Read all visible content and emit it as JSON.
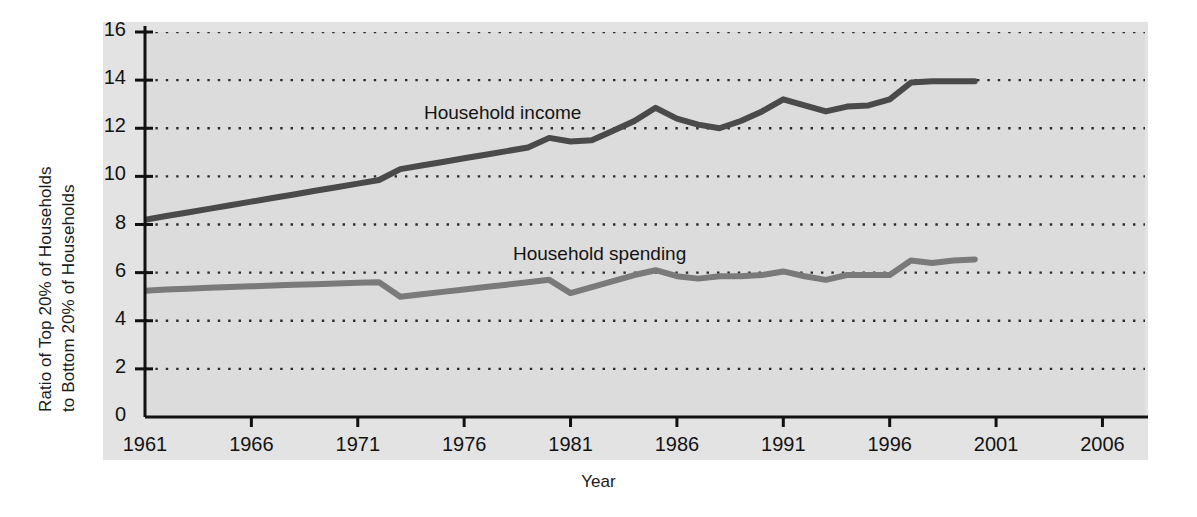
{
  "chart_data": {
    "type": "line",
    "title": "",
    "xlabel": "Year",
    "ylabel_line1": "Ratio of Top 20% of Households",
    "ylabel_line2": "to Bottom 20% of Households",
    "xlim": [
      1961,
      2008
    ],
    "ylim": [
      0,
      16
    ],
    "xticks": [
      "1961",
      "1966",
      "1971",
      "1976",
      "1981",
      "1986",
      "1991",
      "1996",
      "2001",
      "2006"
    ],
    "xtick_values": [
      1961,
      1966,
      1971,
      1976,
      1981,
      1986,
      1991,
      1996,
      2001,
      2006
    ],
    "yticks": [
      "0",
      "2",
      "4",
      "6",
      "8",
      "10",
      "12",
      "14",
      "16"
    ],
    "ytick_values": [
      0,
      2,
      4,
      6,
      8,
      10,
      12,
      14,
      16
    ],
    "grid": "horizontal-dotted",
    "legend_position": "inline-annotations",
    "plot_background": "#dcdcdc",
    "series": [
      {
        "name": "Household income",
        "color": "#4a4a4a",
        "label_x": 1973,
        "label_y": 12.6,
        "x": [
          1961,
          1962,
          1963,
          1964,
          1965,
          1966,
          1967,
          1968,
          1969,
          1970,
          1971,
          1972,
          1973,
          1974,
          1975,
          1976,
          1977,
          1978,
          1979,
          1980,
          1981,
          1982,
          1983,
          1984,
          1985,
          1986,
          1987,
          1988,
          1989,
          1990,
          1991,
          1992,
          1993,
          1994,
          1995,
          1996,
          1997,
          1998,
          1999,
          2000
        ],
        "values": [
          8.2,
          8.35,
          8.5,
          8.65,
          8.8,
          8.95,
          9.1,
          9.25,
          9.4,
          9.55,
          9.7,
          9.85,
          10.3,
          10.45,
          10.6,
          10.75,
          10.9,
          11.05,
          11.2,
          11.6,
          11.45,
          11.5,
          11.9,
          12.3,
          12.85,
          12.4,
          12.15,
          12.0,
          12.3,
          12.7,
          13.2,
          12.95,
          12.7,
          12.9,
          12.95,
          13.2,
          13.9,
          13.95,
          13.95,
          13.95
        ]
      },
      {
        "name": "Household spending",
        "color": "#7a7a7a",
        "label_x": 1980,
        "label_y": 6.9,
        "x": [
          1961,
          1962,
          1963,
          1964,
          1965,
          1966,
          1967,
          1968,
          1969,
          1970,
          1971,
          1972,
          1973,
          1974,
          1975,
          1976,
          1977,
          1978,
          1979,
          1980,
          1981,
          1982,
          1983,
          1984,
          1985,
          1986,
          1987,
          1988,
          1989,
          1990,
          1991,
          1992,
          1993,
          1994,
          1995,
          1996,
          1997,
          1998,
          1999,
          2000
        ],
        "values": [
          5.25,
          5.3,
          5.33,
          5.37,
          5.4,
          5.43,
          5.47,
          5.5,
          5.52,
          5.55,
          5.58,
          5.6,
          5.0,
          5.1,
          5.2,
          5.3,
          5.4,
          5.5,
          5.6,
          5.7,
          5.15,
          5.4,
          5.65,
          5.9,
          6.1,
          5.85,
          5.75,
          5.85,
          5.85,
          5.9,
          6.05,
          5.85,
          5.7,
          5.9,
          5.9,
          5.9,
          6.5,
          6.4,
          6.5,
          6.55
        ]
      }
    ]
  }
}
